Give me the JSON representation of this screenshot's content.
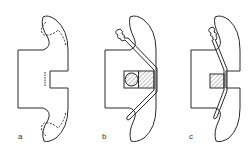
{
  "diagram": {
    "figures": [
      {
        "id": "a",
        "label": "a"
      },
      {
        "id": "b",
        "label": "b"
      },
      {
        "id": "c",
        "label": "c"
      }
    ],
    "colors": {
      "stroke": "#2a2a2a",
      "hatch": "#555555",
      "background": "#ffffff"
    }
  }
}
